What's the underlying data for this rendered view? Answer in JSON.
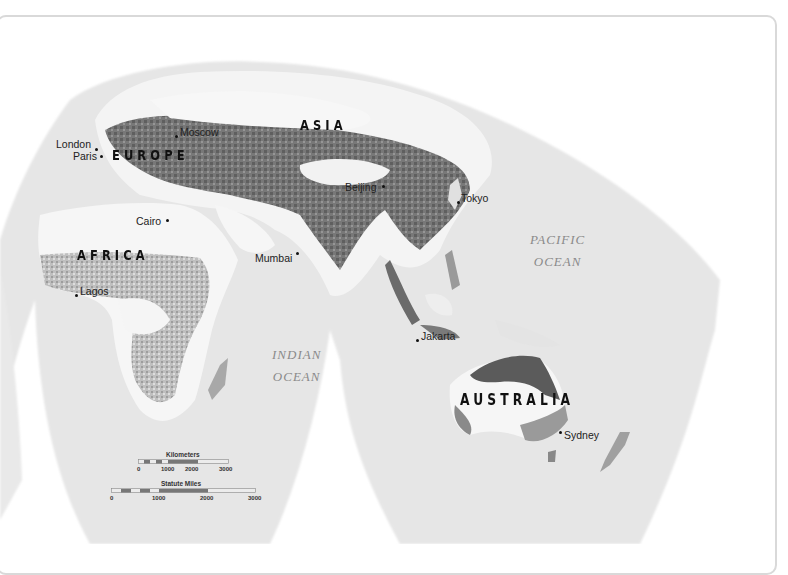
{
  "map": {
    "type": "world-reference-map",
    "projection_style": "interrupted-grayscale",
    "colors": {
      "background": "#ffffff",
      "ocean": "#e6e6e6",
      "land_light": "#f7f7f7",
      "land_mid": "#9a9a9a",
      "land_dark": "#555555",
      "frame": "#d9d9d9",
      "ocean_label": "#8a8a8a",
      "city_label": "#222222"
    },
    "continents": [
      {
        "id": "asia",
        "label": "ASIA"
      },
      {
        "id": "europe",
        "label": "EUROPE"
      },
      {
        "id": "africa",
        "label": "AFRICA"
      },
      {
        "id": "australia",
        "label": "AUSTRALIA"
      }
    ],
    "oceans": [
      {
        "id": "pacific",
        "line1": "PACIFIC",
        "line2": "OCEAN"
      },
      {
        "id": "indian",
        "line1": "INDIAN",
        "line2": "OCEAN"
      }
    ],
    "cities": [
      {
        "id": "moscow",
        "label": "Moscow"
      },
      {
        "id": "london",
        "label": "London"
      },
      {
        "id": "paris",
        "label": "Paris"
      },
      {
        "id": "beijing",
        "label": "Beijing"
      },
      {
        "id": "tokyo",
        "label": "Tokyo"
      },
      {
        "id": "cairo",
        "label": "Cairo"
      },
      {
        "id": "mumbai",
        "label": "Mumbai"
      },
      {
        "id": "lagos",
        "label": "Lagos"
      },
      {
        "id": "jakarta",
        "label": "Jakarta"
      },
      {
        "id": "sydney",
        "label": "Sydney"
      }
    ],
    "scale_bar": {
      "kilometers": {
        "title": "Kilometers",
        "ticks": [
          "0",
          "1000",
          "2000",
          "3000"
        ]
      },
      "miles": {
        "title": "Statute Miles",
        "ticks": [
          "0",
          "1000",
          "2000",
          "3000"
        ]
      }
    }
  }
}
